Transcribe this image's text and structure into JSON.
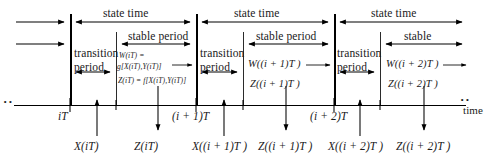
{
  "diagram": {
    "axis_label": "time",
    "ellipsis": "··",
    "labels": {
      "state_time": "state time",
      "stable_period": "stable period",
      "stable_short": "stable",
      "transition": "transition",
      "period": "period"
    },
    "panels": [
      {
        "id": "panel-1",
        "state_time": "state time",
        "stable_label": "stable period",
        "transition_line1": "transition",
        "transition_line2": "period",
        "w_line1": "W(iT) =",
        "w_line2": "g[X(iT),Y(iT)]",
        "z_line": "Z(iT) = f[X(iT),Y(iT)]"
      },
      {
        "id": "panel-2",
        "state_time": "state time",
        "stable_label": "stable period",
        "transition_line1": "transition",
        "transition_line2": "period",
        "w_line1": "W((i + 1)T )",
        "w_line2": "",
        "z_line": "Z((i + 1)T )"
      },
      {
        "id": "panel-3",
        "state_time": "state time",
        "stable_label": "stable",
        "transition_line1": "transition",
        "transition_line2": "period",
        "w_line1": "W((i + 2)T )",
        "w_line2": "",
        "z_line": "Z((i + 2)T )"
      }
    ],
    "ticks": [
      {
        "id": "tick-it",
        "label": "iT"
      },
      {
        "id": "tick-i1t",
        "label": "(i + 1)T"
      },
      {
        "id": "tick-i2t",
        "label": "(i + 2)T"
      }
    ],
    "inputs": [
      {
        "id": "input-x-it",
        "label": "X(iT)"
      },
      {
        "id": "input-x-i1t",
        "label": "X((i + 1)T )"
      },
      {
        "id": "input-x-i2t",
        "label": "X((i + 2)T )"
      }
    ],
    "outputs": [
      {
        "id": "output-z-it",
        "label": "Z(iT)"
      },
      {
        "id": "output-z-i1t",
        "label": "Z((i + 1)T )"
      },
      {
        "id": "output-z-i2t",
        "label": "Z((i + 2)T )"
      }
    ],
    "colors": {
      "ink": "#000000",
      "background": "#ffffff"
    }
  }
}
